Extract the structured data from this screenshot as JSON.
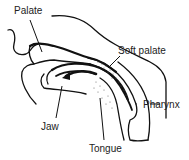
{
  "diagram": {
    "type": "anatomical-cross-section",
    "labels": {
      "palate": "Palate",
      "soft_palate": "Soft palate",
      "jaw": "Jaw",
      "tongue": "Tongue",
      "pharynx": "Pharynx"
    },
    "colors": {
      "line": "#111111",
      "text": "#222222",
      "background": "#ffffff",
      "stipple": "#555555"
    }
  }
}
